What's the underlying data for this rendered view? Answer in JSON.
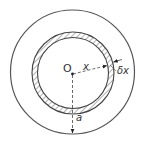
{
  "diagram": {
    "labels": {
      "centre": "O",
      "shell_radius": "x",
      "shell_thickness": "δx",
      "outer_radius": "a"
    },
    "colors": {
      "stroke": "#555555",
      "hatch": "#666666",
      "background": "#ffffff"
    }
  }
}
